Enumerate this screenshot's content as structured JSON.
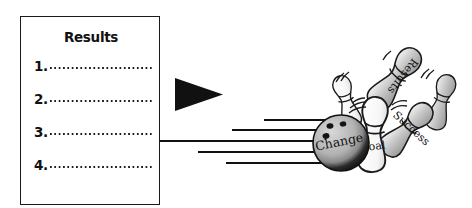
{
  "diagram": {
    "results_box": {
      "heading": "Results",
      "items": [
        {
          "number": "1.",
          "value": ""
        },
        {
          "number": "2.",
          "value": ""
        },
        {
          "number": "3.",
          "value": ""
        },
        {
          "number": "4.",
          "value": ""
        }
      ]
    },
    "arrow": {
      "name": "play-triangle-arrow",
      "direction": "right",
      "color": "#111111"
    },
    "bowling_scene": {
      "ball": {
        "label": "Change",
        "top_color": "#b8b8b8",
        "bottom_color": "#141414",
        "holes": 3
      },
      "pins": [
        {
          "label": "Goal",
          "state": "upright",
          "fill": "#ffffff"
        },
        {
          "label": "Success",
          "state": "falling-right",
          "fill": "#a9a9a9"
        },
        {
          "label": "Results",
          "state": "flying-up-right",
          "fill": "#c4c4c4"
        },
        {
          "label": "",
          "state": "toppling-left",
          "fill": "#ffffff"
        },
        {
          "label": "",
          "state": "toppling-right",
          "fill": "#ffffff"
        },
        {
          "label": "",
          "state": "falling-far-right",
          "fill": "#bdbdbd"
        }
      ],
      "speed_lines": 5,
      "motion_marks": "impact-swoosh-lines"
    },
    "colors": {
      "ink": "#111111",
      "paper": "#ffffff",
      "gray_mid": "#a9a9a9",
      "gray_light": "#d2d2d2"
    }
  }
}
